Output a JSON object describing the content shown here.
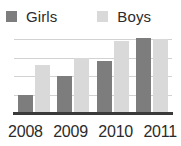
{
  "chart_data": {
    "type": "bar",
    "title": "",
    "subtitle": "",
    "xlabel": "",
    "ylabel": "",
    "categories": [
      "2008",
      "2009",
      "2010",
      "2011"
    ],
    "series": [
      {
        "name": "Girls",
        "color": "#7d7d7d",
        "values": [
          1.0,
          2.0,
          2.8,
          4.1
        ]
      },
      {
        "name": "Boys",
        "color": "#d9d9d9",
        "values": [
          2.6,
          3.0,
          3.9,
          4.0
        ]
      }
    ],
    "ylim": [
      0,
      4.4
    ],
    "y_gridlines": [
      1,
      2,
      3,
      4
    ],
    "grid": true,
    "y_tick_labels": [],
    "legend": {
      "position": "top",
      "entries": [
        {
          "label": "Girls",
          "color": "#7d7d7d"
        },
        {
          "label": "Boys",
          "color": "#d9d9d9"
        }
      ]
    },
    "axis_color": "#3a3a3a",
    "gridline_color": "#d2d2d2",
    "background_color": "#ffffff"
  }
}
